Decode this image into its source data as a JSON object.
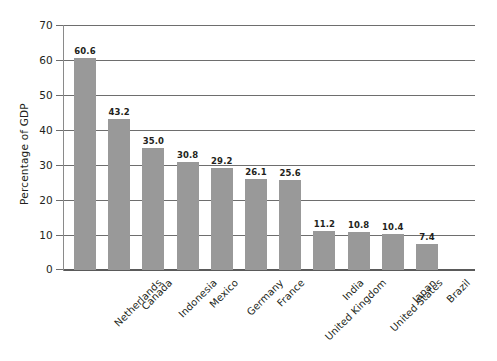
{
  "chart_data": {
    "type": "bar",
    "title": "",
    "subtitle": "",
    "xlabel": "",
    "ylabel": "Percentage of GDP",
    "categories": [
      "Netherlands",
      "Canada",
      "Indonesia",
      "Mexico",
      "Germany",
      "France",
      "United Kingdom",
      "India",
      "United States",
      "Japan",
      "Brazil"
    ],
    "values": [
      60.6,
      43.2,
      35.0,
      30.8,
      29.2,
      26.1,
      25.6,
      11.2,
      10.8,
      10.4,
      7.4
    ],
    "value_labels": [
      "60.6",
      "43.2",
      "35.0",
      "30.8",
      "29.2",
      "26.1",
      "25.6",
      "11.2",
      "10.8",
      "10.4",
      "7.4"
    ],
    "ylim": [
      0,
      70
    ],
    "ytick_values": [
      0,
      10,
      20,
      30,
      40,
      50,
      60,
      70
    ],
    "ytick_labels": [
      "0",
      "10",
      "20",
      "30",
      "40",
      "50",
      "60",
      "70"
    ],
    "grid": "horizontal",
    "legend": "none",
    "bar_color": "#999999",
    "gridline_color": "#6e6e6e",
    "text_color": "#231f20",
    "background": "#ffffff",
    "xtick_label_rotation": "-45"
  }
}
